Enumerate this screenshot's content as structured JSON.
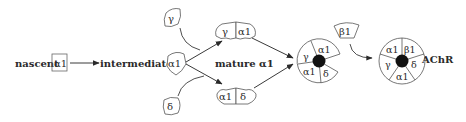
{
  "diagram": {
    "stages": {
      "nascent": {
        "label": "nascent",
        "subunit": "α1"
      },
      "intermediate": {
        "label": "intermediate",
        "subunit": "α1"
      },
      "free_subunits": {
        "gamma": "γ",
        "delta": "δ"
      },
      "mature": {
        "label": "mature α1",
        "dimer_top": [
          "γ",
          "α1"
        ],
        "dimer_bottom": [
          "α1",
          "δ"
        ]
      },
      "tetramer": {
        "segments": [
          "α1",
          "δ",
          "α1",
          "γ"
        ]
      },
      "beta": {
        "subunit": "β1"
      },
      "pentamer": {
        "segments": [
          "α1",
          "β1",
          "δ",
          "α1",
          "γ"
        ],
        "label": "AChR"
      }
    },
    "colors": {
      "line": "#3a3a3a",
      "text": "#2a2a2a",
      "core": "#111111",
      "background": "#ffffff"
    }
  }
}
